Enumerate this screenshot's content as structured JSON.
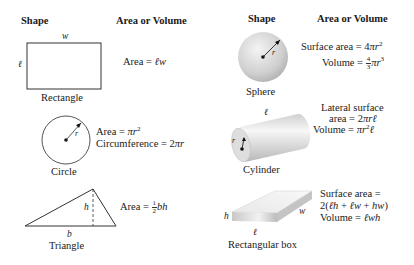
{
  "left_column": {
    "header_shape": "Shape",
    "header_formula": "Area or Volume",
    "rectangle": {
      "name": "Rectangle",
      "label_w": "w",
      "label_l": "ℓ",
      "formula": "Area = ℓw"
    },
    "circle": {
      "name": "Circle",
      "label_r": "r",
      "formula_area": "Area = πr²",
      "formula_circ": "Circumference = 2πr"
    },
    "triangle": {
      "name": "Triangle",
      "label_h": "h",
      "label_b": "b",
      "formula": "Area = ½bh"
    }
  },
  "right_column": {
    "header_shape": "Shape",
    "header_formula": "Area or Volume",
    "sphere": {
      "name": "Sphere",
      "label_r": "r",
      "formula_surface": "Surface area = 4πr²",
      "formula_volume": "Volume = 4/3 πr³"
    },
    "cylinder": {
      "name": "Cylinder",
      "label_l": "ℓ",
      "label_r": "r",
      "formula_lateral_1": "Lateral surface",
      "formula_lateral_2": "area = 2πrℓ",
      "formula_volume": "Volume = πr²ℓ"
    },
    "box": {
      "name": "Rectangular box",
      "label_h": "h",
      "label_w": "w",
      "label_l": "ℓ",
      "formula_surface_1": "Surface area =",
      "formula_surface_2": "2(ℓh + ℓw + hw)",
      "formula_volume": "Volume = ℓwh"
    }
  },
  "colors": {
    "line": "#333333",
    "text": "#1a1a1a",
    "shade_light": "#f2f2f2",
    "shade_dark": "#bdbdbd"
  }
}
